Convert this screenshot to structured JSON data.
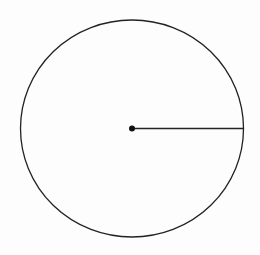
{
  "diagram": {
    "background": "#fdfdfd",
    "stroke": "#222222",
    "circle": {
      "cx": 132,
      "cy": 128.5,
      "rx": 111.5,
      "ry": 108.5
    },
    "center_dot": {
      "cx": 132,
      "cy": 128.5,
      "r": 3
    },
    "radius_line": {
      "x1": 132,
      "y1": 128.5,
      "x2": 243.5,
      "y2": 128.5
    }
  }
}
